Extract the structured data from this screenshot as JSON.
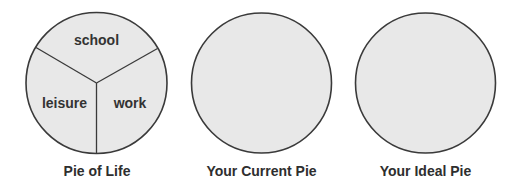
{
  "pies": [
    {
      "caption": "Pie of Life",
      "slices": [
        {
          "label": "school"
        },
        {
          "label": "leisure"
        },
        {
          "label": "work"
        }
      ]
    },
    {
      "caption": "Your Current Pie",
      "slices": []
    },
    {
      "caption": "Your Ideal Pie",
      "slices": []
    }
  ],
  "colors": {
    "fill": "#e8e8e8",
    "stroke": "#3a3a3a",
    "text": "#333333"
  }
}
